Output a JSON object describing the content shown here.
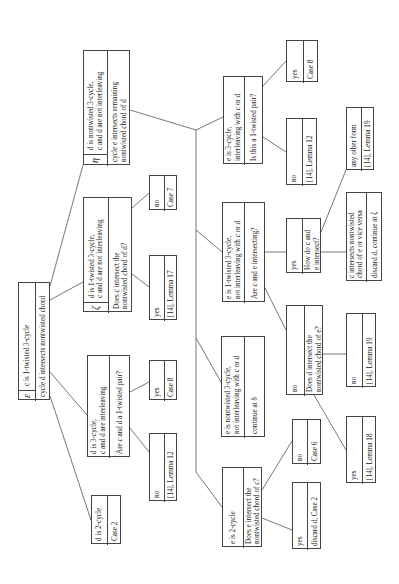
{
  "diagram": {
    "orientation": "rotated 90 degrees counter-clockwise (text reads bottom-to-top)",
    "nodes": {
      "root": {
        "symbol": "ε",
        "rows": [
          [
            "c is 1-twisted 3-cycle"
          ],
          [
            "cycle d intersects nontwisted chord"
          ]
        ]
      },
      "d_2cycle": {
        "rows": [
          [
            "d is 2-cycle"
          ],
          [
            "Case 2"
          ]
        ]
      },
      "d_3cycle": {
        "rows": [
          [
            "d  is 3-cycle,",
            "c and d are interleaving"
          ],
          [
            "Are c and d a 1-twisted pair?"
          ]
        ]
      },
      "d_3cycle_no": {
        "rows": [
          [
            "no"
          ],
          [
            "[14], Lemma 12"
          ]
        ]
      },
      "d_3cycle_yes": {
        "rows": [
          [
            "yes"
          ],
          [
            "Case 8"
          ]
        ]
      },
      "d_1twisted": {
        "symbol": "ζ",
        "rows": [
          [
            "d is 1-twisted 3-cycle,",
            "c and d are not interleaving"
          ],
          [
            "Does c intersect the",
            "nontwisted chord of d?"
          ]
        ]
      },
      "d_1twisted_yes": {
        "rows": [
          [
            "yes"
          ],
          [
            "[14], Lemma 17"
          ]
        ]
      },
      "d_1twisted_no": {
        "rows": [
          [
            "no"
          ],
          [
            "Case 7"
          ]
        ]
      },
      "d_nontwisted": {
        "symbol": "η",
        "rows": [
          [
            "d is nontwisted 3-cycle,",
            "c and d are not interleaving"
          ],
          [
            "cycle e intersects remaining",
            "nontwisted chord of d"
          ]
        ]
      },
      "e_2cycle": {
        "rows": [
          [
            "e is 2-cycle"
          ],
          [
            "Does e intersect the",
            "nontwisted chord of c?"
          ]
        ]
      },
      "e_2cycle_yes": {
        "rows": [
          [
            "yes"
          ],
          [
            "discard d, Case 2"
          ]
        ]
      },
      "e_2cycle_no": {
        "rows": [
          [
            "no"
          ],
          [
            "Case 6"
          ]
        ]
      },
      "e_nontwisted": {
        "rows": [
          [
            "e is nontwisted 3-cycle,",
            "not interleaving with c or d"
          ],
          [
            "continue at δ"
          ]
        ]
      },
      "e_1twisted": {
        "rows": [
          [
            "e is 1-twisted 3-cycle,",
            "not interleaving with c or d"
          ],
          [
            "Are c and e intersecting?"
          ]
        ]
      },
      "e_1twisted_no": {
        "rows": [
          [
            "no"
          ],
          [
            "Does d intersect the",
            "nontwisted chord of e?"
          ]
        ]
      },
      "e_1twisted_no_yes": {
        "rows": [
          [
            "yes"
          ],
          [
            "[14], Lemma 18"
          ]
        ]
      },
      "e_1twisted_no_no": {
        "rows": [
          [
            "no"
          ],
          [
            "[14], Lemma 19"
          ]
        ]
      },
      "e_1twisted_yes": {
        "rows": [
          [
            "yes"
          ],
          [
            "How do c and",
            "e intersect?"
          ]
        ]
      },
      "e_1twisted_yes_form": {
        "rows": [
          [
            "c intersects nontwisted",
            "chord of e or vice versa"
          ],
          [
            "discard d, continue at ζ"
          ]
        ]
      },
      "e_1twisted_yes_other": {
        "rows": [
          [
            "any other form"
          ],
          [
            "[14], Lemma 19"
          ]
        ]
      },
      "e_3cycle": {
        "rows": [
          [
            "e is 3-cycle,",
            "interleaving with c or d"
          ],
          [
            "Is this a 1-twisted pair?"
          ]
        ]
      },
      "e_3cycle_no": {
        "rows": [
          [
            "no"
          ],
          [
            "[14], Lemma 12"
          ]
        ]
      },
      "e_3cycle_yes": {
        "rows": [
          [
            "yes"
          ],
          [
            "Case 8"
          ]
        ]
      }
    },
    "edges": [
      [
        "root",
        "d_2cycle"
      ],
      [
        "root",
        "d_3cycle"
      ],
      [
        "root",
        "d_1twisted"
      ],
      [
        "root",
        "d_nontwisted"
      ],
      [
        "d_3cycle",
        "d_3cycle_no"
      ],
      [
        "d_3cycle",
        "d_3cycle_yes"
      ],
      [
        "d_1twisted",
        "d_1twisted_yes"
      ],
      [
        "d_1twisted",
        "d_1twisted_no"
      ],
      [
        "d_nontwisted",
        "e_2cycle"
      ],
      [
        "d_nontwisted",
        "e_nontwisted"
      ],
      [
        "d_nontwisted",
        "e_1twisted"
      ],
      [
        "d_nontwisted",
        "e_3cycle"
      ],
      [
        "e_2cycle",
        "e_2cycle_yes"
      ],
      [
        "e_2cycle",
        "e_2cycle_no"
      ],
      [
        "e_1twisted",
        "e_1twisted_no"
      ],
      [
        "e_1twisted",
        "e_1twisted_yes"
      ],
      [
        "e_1twisted_no",
        "e_1twisted_no_yes"
      ],
      [
        "e_1twisted_no",
        "e_1twisted_no_no"
      ],
      [
        "e_1twisted_yes",
        "e_1twisted_yes_form"
      ],
      [
        "e_1twisted_yes",
        "e_1twisted_yes_other"
      ],
      [
        "e_3cycle",
        "e_3cycle_no"
      ],
      [
        "e_3cycle",
        "e_3cycle_yes"
      ]
    ]
  }
}
